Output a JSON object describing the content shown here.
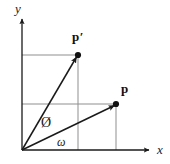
{
  "figure": {
    "type": "vector-rotation-diagram",
    "background_color": "#ffffff",
    "stroke_color": "#1a1a1a",
    "guide_color": "#8a8a8a",
    "axes": {
      "x_label": "x",
      "y_label": "y",
      "origin_px": [
        22,
        150
      ],
      "x_axis_end_px": [
        152,
        150
      ],
      "y_axis_end_px": [
        22,
        16
      ]
    },
    "vectors": [
      {
        "name": "p",
        "label": "p",
        "tip_px": [
          116,
          104
        ],
        "label_px": [
          121,
          82
        ],
        "dot": true,
        "guide_horizontal_to_px": [
          22,
          104
        ],
        "guide_vertical_to_px": [
          116,
          150
        ]
      },
      {
        "name": "p-prime",
        "label": "p′",
        "tip_px": [
          78,
          55
        ],
        "label_px": [
          72,
          30
        ],
        "dot": true,
        "guide_horizontal_to_px": [
          22,
          55
        ],
        "guide_vertical_to_px": [
          78,
          150
        ]
      }
    ],
    "angles": [
      {
        "name": "phi",
        "label": "Ø",
        "description": "angle between vector p and vector p-prime",
        "label_px": [
          41,
          116
        ]
      },
      {
        "name": "omega",
        "label": "ω",
        "description": "angle between x axis and vector p",
        "label_px": [
          57,
          136
        ]
      }
    ]
  }
}
